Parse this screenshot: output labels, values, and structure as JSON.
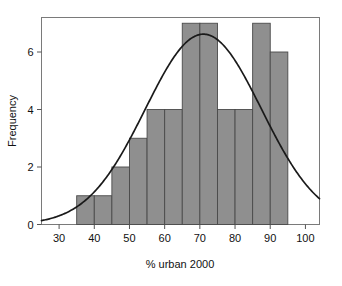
{
  "chart_data": {
    "type": "bar",
    "title": "",
    "subtitle": "",
    "xlabel": "% urban 2000",
    "ylabel": "Frequency",
    "xlim": [
      25,
      104
    ],
    "ylim": [
      0,
      7.2
    ],
    "xticks": [
      30,
      40,
      50,
      60,
      70,
      80,
      90,
      100
    ],
    "xtick_labels": [
      "30",
      "40",
      "50",
      "60",
      "70",
      "80",
      "90",
      "100"
    ],
    "yticks": [
      0,
      2,
      4,
      6
    ],
    "ytick_labels": [
      "0",
      "2",
      "4",
      "6"
    ],
    "grid": false,
    "legend": null,
    "bin_width": 5,
    "bin_edges": [
      35,
      40,
      45,
      50,
      55,
      60,
      65,
      70,
      75,
      80,
      85,
      90,
      95
    ],
    "categories": [
      "35-40",
      "40-45",
      "45-50",
      "50-55",
      "55-60",
      "60-65",
      "65-70",
      "70-75",
      "75-80",
      "80-85",
      "85-90",
      "90-95"
    ],
    "values": [
      1,
      1,
      2,
      3,
      4,
      4,
      7,
      7,
      4,
      4,
      7,
      6
    ],
    "series": [
      {
        "name": "Frequency",
        "type": "bar",
        "values": [
          1,
          1,
          2,
          3,
          4,
          4,
          7,
          7,
          4,
          4,
          7,
          6
        ],
        "color": "#8f8f8f",
        "edge_color": "#4a4a4a"
      },
      {
        "name": "normal-curve",
        "type": "line",
        "color": "#1a1a1a",
        "mean": 71,
        "sigma": 16.5,
        "peak_value": 6.62,
        "x": [
          25,
          30,
          35,
          40,
          45,
          50,
          55,
          60,
          65,
          70,
          71,
          75,
          80,
          85,
          90,
          95,
          100,
          104
        ],
        "y": [
          0.12,
          0.29,
          0.6,
          1.1,
          1.83,
          2.77,
          3.84,
          4.91,
          5.81,
          6.37,
          6.62,
          6.35,
          5.8,
          4.9,
          3.83,
          2.76,
          1.82,
          1.2
        ]
      }
    ],
    "annotations": []
  },
  "figure": {
    "background_color": "#ffffff",
    "frame_color": "#6e6e6e",
    "text_color": "#111111"
  }
}
